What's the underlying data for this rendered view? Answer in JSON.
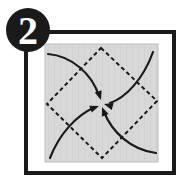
{
  "diagram": {
    "kind": "origami-instruction-step",
    "step_badge": {
      "label": "2",
      "shape": "filled-circle",
      "fill_color": "#1a1a1a",
      "text_color": "#ffffff",
      "center": [
        28,
        30
      ],
      "radius": 22
    },
    "frame": {
      "stroke_color": "#1a1a1a",
      "stroke_width": 4,
      "x": 26,
      "y": 32,
      "width": 148,
      "height": 141,
      "fill": "#ffffff"
    },
    "paper": {
      "description": "square sheet of paper seen from the front",
      "fill_color": "#d8d8d8",
      "edge_color": "#b8b8b8",
      "x": 45,
      "y": 44,
      "width": 113,
      "height": 118
    },
    "fold_lines": [
      {
        "name": "inscribed-diamond",
        "style": "dashed",
        "stroke_color": "#1a1a1a",
        "stroke_width": 2,
        "dash_pattern": "4 3",
        "points": [
          [
            101,
            48
          ],
          [
            157,
            101
          ],
          [
            102,
            158
          ],
          [
            47,
            104
          ]
        ],
        "closed": true,
        "meaning": "valley fold - fold each corner of the square in to the center"
      }
    ],
    "arrows": [
      {
        "name": "fold-arrow-from-top-left",
        "path": "M 48,54 C 72,56 92,74 99,96",
        "head_at": [
          101,
          100
        ],
        "head_angle_deg": 72,
        "stroke_color": "#1a1a1a",
        "stroke_width": 2.2
      },
      {
        "name": "fold-arrow-from-top-right",
        "path": "M 153,52 C 143,80 125,98 110,103",
        "head_at": [
          104,
          104
        ],
        "head_angle_deg": 196,
        "stroke_color": "#1a1a1a",
        "stroke_width": 2.2
      },
      {
        "name": "fold-arrow-from-bottom-left",
        "path": "M 50,158 C 60,132 78,115 93,108",
        "head_at": [
          99,
          106
        ],
        "head_angle_deg": 340,
        "stroke_color": "#1a1a1a",
        "stroke_width": 2.2
      },
      {
        "name": "fold-arrow-from-bottom-right",
        "path": "M 156,153 C 131,150 112,132 104,112",
        "head_at": [
          102,
          107
        ],
        "head_angle_deg": 249,
        "stroke_color": "#1a1a1a",
        "stroke_width": 2.2
      }
    ],
    "convergence_point": [
      101,
      103
    ]
  }
}
